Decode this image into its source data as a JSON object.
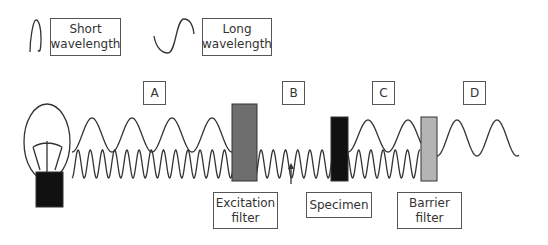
{
  "legend": {
    "short": {
      "label_line1": "Short",
      "label_line2": "wavelength"
    },
    "long": {
      "label_line1": "Long",
      "label_line2": "wavelength"
    }
  },
  "regions": [
    "A",
    "B",
    "C",
    "D"
  ],
  "components": {
    "excitation": {
      "line1": "Excitation",
      "line2": "filter",
      "color": "#6e6e6e"
    },
    "specimen": {
      "line1": "Specimen",
      "color": "#111111"
    },
    "barrier": {
      "line1": "Barrier",
      "line2": "filter",
      "color": "#b4b4b4"
    }
  },
  "colors": {
    "stroke": "#333333",
    "bulb_base": "#111111"
  }
}
